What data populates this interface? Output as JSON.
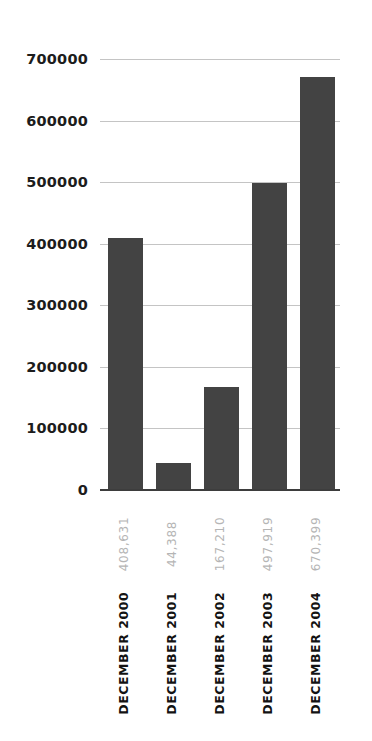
{
  "chart_data": {
    "type": "bar",
    "title": "",
    "subtitle": "",
    "xlabel": "",
    "ylabel": "",
    "categories": [
      "DECEMBER 2000",
      "DECEMBER 2001",
      "DECEMBER 2002",
      "DECEMBER 2003",
      "DECEMBER 2004"
    ],
    "values": [
      408631,
      44388,
      167210,
      497919,
      670399
    ],
    "value_labels": [
      "408,631",
      "44,388",
      "167,210",
      "497,919",
      "670,399"
    ],
    "ylim": [
      0,
      700000
    ],
    "yticks": [
      0,
      100000,
      200000,
      300000,
      400000,
      500000,
      600000,
      700000
    ],
    "ytick_labels": [
      "0",
      "100000",
      "200000",
      "300000",
      "400000",
      "500000",
      "600000",
      "700000"
    ],
    "grid": true,
    "grid_axis": "y",
    "legend": false,
    "legend_position": "none",
    "series": [
      {
        "name": "",
        "values": [
          408631,
          44388,
          167210,
          497919,
          670399
        ]
      }
    ]
  },
  "style": {
    "bar_color": "#434343",
    "grid_color": "#c4c4c4",
    "axis_color": "#3d3d3d",
    "tick_label_color": "#1c1c1c",
    "value_label_color": "#b5b5b5",
    "category_label_color": "#131313",
    "background": "#ffffff"
  }
}
